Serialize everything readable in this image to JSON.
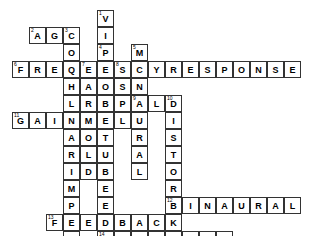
{
  "puzzle": {
    "title": "Audiology Crossword Grid",
    "grid": {
      "cell_size": 17,
      "origin_x": 12,
      "origin_y": 10,
      "cols": 16,
      "rows": 14,
      "cell_fill": "#ffffff",
      "cell_border": "#333333",
      "letter_color": "#000000",
      "background": "#ffffff"
    },
    "entries": [
      {
        "number": "1",
        "direction": "down",
        "answer": "VIBROTACTILE",
        "start_col": 5,
        "start_row": 0
      },
      {
        "number": "2",
        "direction": "across",
        "answer": "AGC",
        "start_col": 1,
        "start_row": 1
      },
      {
        "number": "3",
        "direction": "down",
        "answer": "COCHLEARIMPLANT",
        "start_col": 3,
        "start_row": 1
      },
      {
        "number": "4",
        "direction": "down",
        "answer": "PROBETUBE",
        "start_col": 5,
        "start_row": 2
      },
      {
        "number": "5",
        "direction": "down",
        "answer": "MONAURAL",
        "start_col": 7,
        "start_row": 2
      },
      {
        "number": "6",
        "direction": "across",
        "answer": "FREQUENCYRESPONSE",
        "start_col": 0,
        "start_row": 3
      },
      {
        "number": "7",
        "direction": "down",
        "answer": "EARMOLD",
        "start_col": 4,
        "start_row": 3
      },
      {
        "number": "8",
        "direction": "down",
        "answer": "SSPL",
        "start_col": 6,
        "start_row": 3
      },
      {
        "number": "9",
        "direction": "across",
        "answer": "ALD",
        "start_col": 7,
        "start_row": 5
      },
      {
        "number": "10",
        "direction": "down",
        "answer": "DISTORTION",
        "start_col": 9,
        "start_row": 5
      },
      {
        "number": "11",
        "direction": "across",
        "answer": "GAIN",
        "start_col": 0,
        "start_row": 6
      },
      {
        "number": "12",
        "direction": "across",
        "answer": "BINAURAL",
        "start_col": 9,
        "start_row": 11
      },
      {
        "number": "13",
        "direction": "across",
        "answer": "FEEDBACK",
        "start_col": 2,
        "start_row": 12
      },
      {
        "number": "14",
        "direction": "across",
        "answer": "TELECOIL",
        "start_col": 5,
        "start_row": 13
      }
    ]
  }
}
